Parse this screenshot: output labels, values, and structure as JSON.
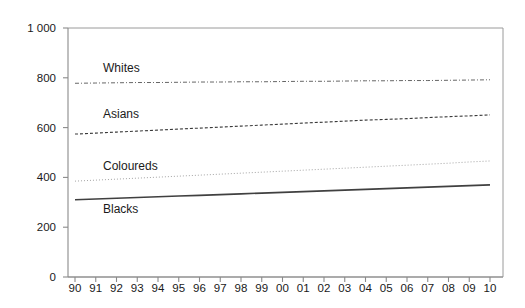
{
  "chart_data": {
    "type": "line",
    "title": "",
    "subtitle": "",
    "xlabel": "",
    "ylabel": "",
    "x": [
      "90",
      "91",
      "92",
      "93",
      "94",
      "95",
      "96",
      "97",
      "98",
      "99",
      "00",
      "01",
      "02",
      "03",
      "04",
      "05",
      "06",
      "07",
      "08",
      "09",
      "10"
    ],
    "categories": [
      "90",
      "91",
      "92",
      "93",
      "94",
      "95",
      "96",
      "97",
      "98",
      "99",
      "00",
      "01",
      "02",
      "03",
      "04",
      "05",
      "06",
      "07",
      "08",
      "09",
      "10"
    ],
    "xtick_labels": [
      "90",
      "91",
      "92",
      "93",
      "94",
      "95",
      "96",
      "97",
      "98",
      "99",
      "00",
      "01",
      "02",
      "03",
      "04",
      "05",
      "06",
      "07",
      "08",
      "09",
      "10"
    ],
    "ytick_labels": [
      "1 000",
      "800",
      "600",
      "400",
      "200",
      "0"
    ],
    "ytick_values": [
      1000,
      800,
      600,
      400,
      200,
      0
    ],
    "ylim": [
      0,
      1000
    ],
    "grid": false,
    "legend_position": "inline-labels",
    "series": [
      {
        "name": "Whites",
        "label": "Whites",
        "line_style": "dash-dot",
        "color": "#555555",
        "width": 0.9,
        "label_x": 103,
        "label_y": 72,
        "values": [
          778,
          779,
          780,
          781,
          781,
          782,
          783,
          783,
          784,
          784,
          785,
          786,
          786,
          787,
          788,
          788,
          789,
          789,
          790,
          791,
          792
        ]
      },
      {
        "name": "Asians",
        "label": "Asians",
        "line_style": "dashed",
        "color": "#3a3a3a",
        "width": 1.1,
        "label_x": 103,
        "label_y": 118,
        "values": [
          574,
          578,
          582,
          586,
          590,
          594,
          598,
          602,
          606,
          610,
          614,
          618,
          622,
          626,
          630,
          633,
          636,
          640,
          644,
          647,
          651
        ]
      },
      {
        "name": "Coloureds",
        "label": "Coloureds",
        "line_style": "dotted",
        "color": "#9a9a9a",
        "width": 0.9,
        "label_x": 103,
        "label_y": 170,
        "values": [
          385,
          389,
          393,
          397,
          401,
          405,
          409,
          413,
          417,
          421,
          425,
          429,
          433,
          437,
          441,
          445,
          449,
          453,
          457,
          462,
          466
        ]
      },
      {
        "name": "Blacks",
        "label": "Blacks",
        "line_style": "solid",
        "color": "#404040",
        "width": 1.6,
        "label_x": 103,
        "label_y": 213,
        "values": [
          310,
          313,
          316,
          319,
          322,
          325,
          328,
          331,
          334,
          337,
          340,
          343,
          346,
          349,
          352,
          355,
          358,
          361,
          364,
          367,
          370
        ]
      }
    ]
  },
  "plot": {
    "left": 68,
    "right": 503,
    "top": 28,
    "bottom": 277,
    "data_left": 75,
    "data_right": 490,
    "ytick_label_x": 56,
    "xtick_label_y": 292,
    "tick_length": 5
  },
  "colors": {
    "axis": "#8a8a8a",
    "frame": "#9a9a9a",
    "text": "#1a1a1a",
    "background": "#ffffff"
  }
}
